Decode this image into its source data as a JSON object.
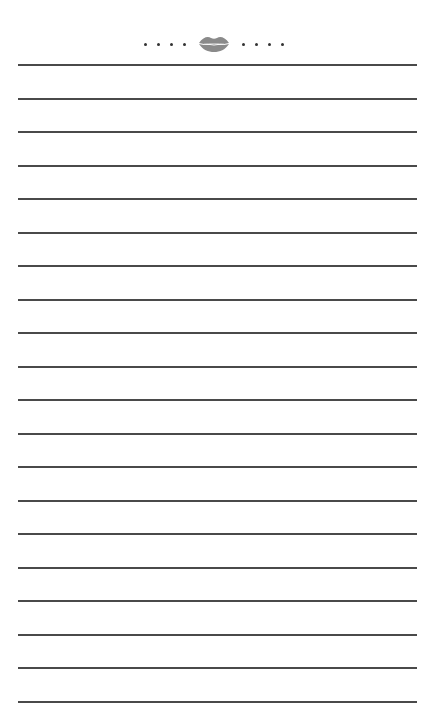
{
  "page": {
    "type": "lined-notepad",
    "background_color": "#ffffff",
    "line_color": "#4a4a4a"
  },
  "header": {
    "ornament": {
      "left_dots": 4,
      "right_dots": 4,
      "center_icon": "lips-kiss-icon",
      "icon_color": "#8a8a8a",
      "dot_color": "#333333"
    }
  },
  "lines": {
    "count": 20,
    "first_y": 64,
    "spacing": 33.5,
    "left": 18,
    "right": 417
  }
}
